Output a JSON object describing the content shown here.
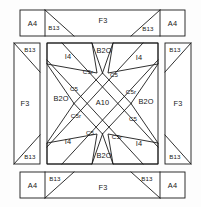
{
  "diagram": {
    "type": "quilt-block-cutting-layout",
    "canvas": {
      "width": 201,
      "height": 207
    },
    "stroke_color": "#1a1a1a",
    "patch_fill": "#ffffff",
    "background": "#fdfdfd",
    "top_border": {
      "name": "top-border-strip",
      "patches": [
        {
          "id": "top-a4-left",
          "label": "A4",
          "shape": "rectangle",
          "x": 20,
          "y": 10,
          "w": 25,
          "h": 26
        },
        {
          "id": "top-b13-left",
          "label": "B13",
          "shape": "triangle",
          "orientation": "diagonal-tl-br",
          "x": 45,
          "y": 10,
          "w": 29,
          "h": 26
        },
        {
          "id": "top-f3",
          "label": "F3",
          "shape": "trapezoid",
          "x": 45,
          "y": 10,
          "w": 115,
          "h": 26
        },
        {
          "id": "top-b13-right",
          "label": "B13",
          "shape": "triangle",
          "orientation": "diagonal-bl-tr",
          "x": 131,
          "y": 10,
          "w": 29,
          "h": 26
        },
        {
          "id": "top-a4-right",
          "label": "A4",
          "shape": "rectangle",
          "x": 160,
          "y": 10,
          "w": 25,
          "h": 26
        }
      ]
    },
    "left_border": {
      "name": "left-border-strip",
      "patches": [
        {
          "id": "left-b13-top",
          "label": "B13",
          "shape": "triangle",
          "orientation": "diagonal-tl-br",
          "x": 14,
          "y": 43,
          "w": 26,
          "h": 29
        },
        {
          "id": "left-f3",
          "label": "F3",
          "shape": "trapezoid",
          "x": 14,
          "y": 43,
          "w": 26,
          "h": 121
        },
        {
          "id": "left-b13-bottom",
          "label": "B13",
          "shape": "triangle",
          "orientation": "diagonal-bl-tr",
          "x": 14,
          "y": 135,
          "w": 26,
          "h": 29
        }
      ]
    },
    "right_border": {
      "name": "right-border-strip",
      "patches": [
        {
          "id": "right-b13-top",
          "label": "B13",
          "shape": "triangle",
          "orientation": "diagonal-bl-tr",
          "x": 165,
          "y": 43,
          "w": 26,
          "h": 29
        },
        {
          "id": "right-f3",
          "label": "F3",
          "shape": "trapezoid",
          "x": 165,
          "y": 43,
          "w": 26,
          "h": 121
        },
        {
          "id": "right-b13-bottom",
          "label": "B13",
          "shape": "triangle",
          "orientation": "diagonal-tl-br",
          "x": 165,
          "y": 135,
          "w": 26,
          "h": 29
        }
      ]
    },
    "bottom_border": {
      "name": "bottom-border-strip",
      "patches": [
        {
          "id": "bottom-a4-left",
          "label": "A4",
          "shape": "rectangle",
          "x": 20,
          "y": 172,
          "w": 25,
          "h": 26
        },
        {
          "id": "bottom-b13-left",
          "label": "B13",
          "shape": "triangle",
          "orientation": "diagonal-tr-bl",
          "x": 45,
          "y": 172,
          "w": 29,
          "h": 26
        },
        {
          "id": "bottom-f3",
          "label": "F3",
          "shape": "trapezoid",
          "x": 45,
          "y": 172,
          "w": 115,
          "h": 26
        },
        {
          "id": "bottom-b13-right",
          "label": "B13",
          "shape": "triangle",
          "orientation": "diagonal-tl-br",
          "x": 131,
          "y": 172,
          "w": 29,
          "h": 26
        },
        {
          "id": "bottom-a4-right",
          "label": "A4",
          "shape": "rectangle",
          "x": 160,
          "y": 172,
          "w": 25,
          "h": 26
        }
      ]
    },
    "center_block": {
      "name": "center-star-block",
      "bounds": {
        "x": 47,
        "y": 43,
        "w": 111,
        "h": 121
      },
      "center_patch": {
        "id": "center-a10",
        "label": "A10",
        "shape": "square-on-point"
      },
      "corner_patches": [
        {
          "id": "corner-i4-tl",
          "label": "I4",
          "position": "top-left"
        },
        {
          "id": "corner-i4-tr",
          "label": "I4",
          "position": "top-right"
        },
        {
          "id": "corner-i4-bl",
          "label": "I4",
          "position": "bottom-left"
        },
        {
          "id": "corner-i4-br",
          "label": "I4",
          "position": "bottom-right"
        }
      ],
      "point_patches": [
        {
          "id": "point-b20-top",
          "label": "B2O",
          "position": "top"
        },
        {
          "id": "point-b20-left",
          "label": "B2O",
          "position": "left"
        },
        {
          "id": "point-b20-right",
          "label": "B2O",
          "position": "right"
        },
        {
          "id": "point-b20-bottom",
          "label": "B2O",
          "position": "bottom"
        }
      ],
      "spike_patches": [
        {
          "id": "spike-c5r-top",
          "label": "C5r",
          "position": "top-inner-left"
        },
        {
          "id": "spike-c5-topright",
          "label": "C5",
          "position": "top-inner-right"
        },
        {
          "id": "spike-c5-left",
          "label": "C5",
          "position": "left-inner-top"
        },
        {
          "id": "spike-c5r-right",
          "label": "C5r",
          "position": "right-inner-top"
        },
        {
          "id": "spike-c5r-left",
          "label": "C5r",
          "position": "left-inner-bottom"
        },
        {
          "id": "spike-c5-right",
          "label": "C5",
          "position": "right-inner-bottom"
        },
        {
          "id": "spike-c5-bottom",
          "label": "C5",
          "position": "bottom-inner-left"
        },
        {
          "id": "spike-c5r-bottom",
          "label": "C5r",
          "position": "bottom-inner-right"
        }
      ]
    },
    "piece_legend": {
      "A4": "A4",
      "A10": "A10",
      "B13": "B13",
      "B20": "B2O",
      "C5": "C5",
      "C5r": "C5r",
      "F3": "F3",
      "I4": "I4"
    }
  }
}
